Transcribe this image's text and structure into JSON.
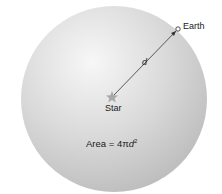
{
  "diagram": {
    "sphere": {
      "cx": 114,
      "cy": 99,
      "r": 93,
      "fill_light": "#f4f4f4",
      "fill_dark": "#bdbdbd"
    },
    "star": {
      "label": "Star",
      "x": 112,
      "y": 97,
      "color": "#9a9a9a"
    },
    "earth": {
      "label": "Earth",
      "x": 178,
      "y": 28
    },
    "distance": {
      "label": "d"
    },
    "formula": {
      "prefix": "Area = 4",
      "pi": "π",
      "var": "d",
      "exp": "2"
    }
  }
}
